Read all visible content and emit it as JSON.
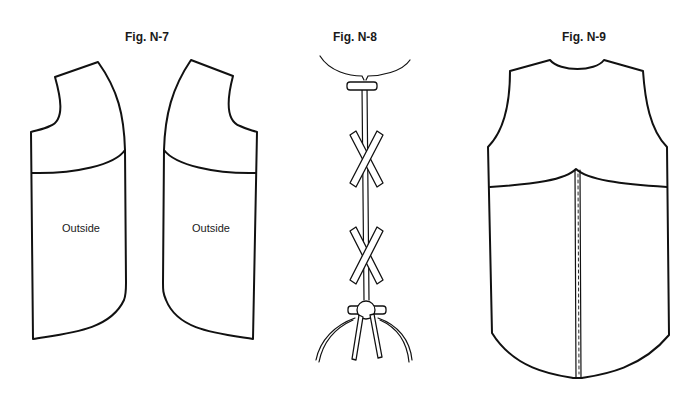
{
  "figures": [
    {
      "id": "N-7",
      "title": "Fig. N-7",
      "description": "Two vest front panels, mirrored, with yoke seam line",
      "panels": [
        {
          "label": "Outside"
        },
        {
          "label": "Outside"
        }
      ]
    },
    {
      "id": "N-8",
      "title": "Fig. N-8",
      "description": "Lacing detail: bar at neck, two crossed laces, tied knot with hanging ends"
    },
    {
      "id": "N-9",
      "title": "Fig. N-9",
      "description": "Vest back with curved yoke seam and center back stitched seam"
    }
  ],
  "colors": {
    "stroke": "#111111",
    "background": "#ffffff"
  }
}
